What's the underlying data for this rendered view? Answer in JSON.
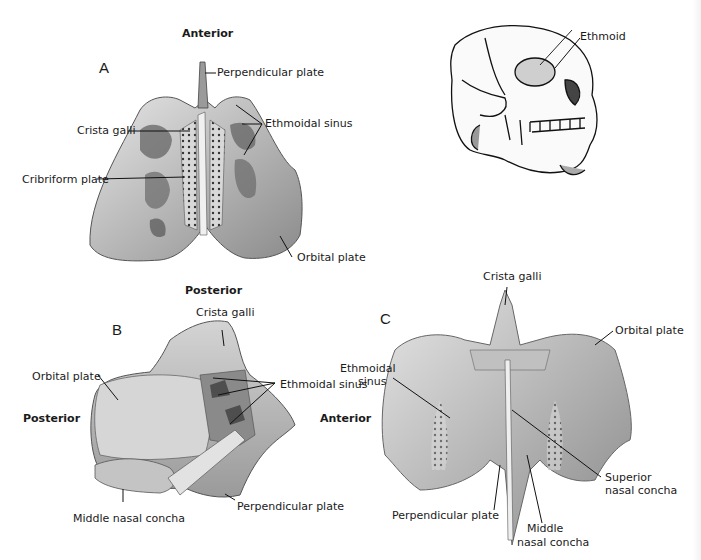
{
  "figure": {
    "panels": [
      {
        "id": "A",
        "letter": "A",
        "orientation": {
          "top": "Anterior",
          "bottom": "Posterior"
        },
        "labels": [
          "Perpendicular plate",
          "Crista galli",
          "Ethmoidal sinus",
          "Cribriform plate",
          "Orbital plate"
        ]
      },
      {
        "id": "skull",
        "labels": [
          "Ethmoid"
        ]
      },
      {
        "id": "B",
        "letter": "B",
        "orientation": {
          "left": "Posterior",
          "right": "Anterior"
        },
        "labels": [
          "Crista galli",
          "Orbital plate",
          "Ethmoidal sinus",
          "Middle nasal concha",
          "Perpendicular plate"
        ]
      },
      {
        "id": "C",
        "letter": "C",
        "labels": [
          "Crista galli",
          "Ethmoidal sinus",
          "Orbital plate",
          "Superior nasal concha",
          "Perpendicular plate",
          "Middle nasal concha"
        ]
      }
    ]
  },
  "a": {
    "letter": "A",
    "anterior": "Anterior",
    "posterior": "Posterior",
    "perpendicular_plate": "Perpendicular plate",
    "crista_galli": "Crista galli",
    "ethmoidal_sinus": "Ethmoidal sinus",
    "cribriform_plate": "Cribriform plate",
    "orbital_plate": "Orbital plate"
  },
  "skull": {
    "ethmoid": "Ethmoid"
  },
  "b": {
    "letter": "B",
    "crista_galli": "Crista galli",
    "orbital_plate": "Orbital plate",
    "ethmoidal_sinus": "Ethmoidal sinus",
    "posterior": "Posterior",
    "middle_nasal_concha": "Middle nasal concha",
    "perpendicular_plate": "Perpendicular plate"
  },
  "c": {
    "letter": "C",
    "crista_galli": "Crista galli",
    "ethmoidal_sinus_line1": "Ethmoidal",
    "ethmoidal_sinus_line2": "sinus",
    "anterior": "Anterior",
    "orbital_plate": "Orbital plate",
    "superior_line1": "Superior",
    "superior_line2": "nasal concha",
    "perpendicular_plate": "Perpendicular plate",
    "middle_line1": "Middle",
    "middle_line2": "nasal concha"
  },
  "colors": {
    "bone_light": "#d9d9d9",
    "bone_mid": "#a9a9a9",
    "bone_dark": "#6e6e6e",
    "line": "#111111",
    "background": "#ffffff"
  }
}
